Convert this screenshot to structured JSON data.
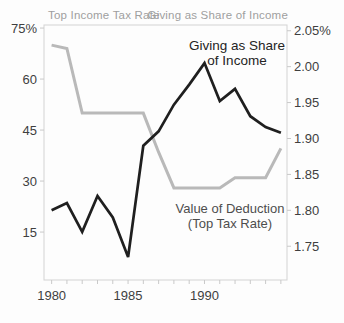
{
  "chart_data": {
    "type": "line",
    "title": "",
    "x": [
      1980,
      1981,
      1982,
      1983,
      1984,
      1985,
      1986,
      1987,
      1988,
      1989,
      1990,
      1991,
      1992,
      1993,
      1994,
      1995
    ],
    "x_axis": {
      "tick_labels": [
        "1980",
        "1985",
        "1990"
      ],
      "tick_values": [
        1980,
        1985,
        1990
      ],
      "minor_tick_step_years": 1,
      "range": [
        1979.5,
        1995.4
      ]
    },
    "left_axis": {
      "title": "Top Income Tax Rate",
      "tick_labels": [
        "75%",
        "60",
        "45",
        "30",
        "15"
      ],
      "tick_values": [
        75,
        60,
        45,
        30,
        15
      ],
      "range": [
        0.9,
        75.9
      ]
    },
    "right_axis": {
      "title": "Giving as Share of Income",
      "tick_labels": [
        "2.05%",
        "2.00",
        "1.95",
        "1.90",
        "1.85",
        "1.80",
        "1.75"
      ],
      "tick_values": [
        2.05,
        2.0,
        1.95,
        1.9,
        1.85,
        1.8,
        1.75
      ],
      "range": [
        1.703,
        2.058
      ]
    },
    "series": [
      {
        "name": "Value of Deduction (Top Tax Rate)",
        "axis": "left",
        "color": "#b9b9b9",
        "stroke_width": 3,
        "values": [
          70,
          69,
          50,
          50,
          50,
          50,
          50,
          38.5,
          28,
          28,
          28,
          28,
          31,
          31,
          31,
          39.6
        ]
      },
      {
        "name": "Giving as Share of Income",
        "axis": "right",
        "color": "#1f1f1f",
        "stroke_width": 2.7,
        "values": [
          1.8,
          1.81,
          1.77,
          1.82,
          1.79,
          1.735,
          1.89,
          1.91,
          1.947,
          1.975,
          2.005,
          1.952,
          1.969,
          1.931,
          1.916,
          1.908
        ]
      }
    ],
    "annotations": [
      {
        "id": "giving",
        "lines": [
          "Giving as Share",
          "of Income"
        ],
        "color": "#242424"
      },
      {
        "id": "deduction",
        "lines": [
          "Value of Deduction",
          "(Top Tax Rate)"
        ],
        "color": "#4d4d4d"
      }
    ],
    "grid": false,
    "legend": "none",
    "colors": {
      "frame": "#d3d3d3",
      "tick": "#c9c9c9",
      "tick_label": "#3f3f3f",
      "axis_title": "#9f9f9f"
    }
  }
}
